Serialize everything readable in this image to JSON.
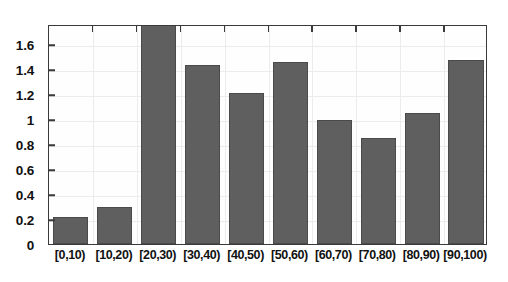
{
  "chart_data": {
    "type": "bar",
    "title": "",
    "xlabel": "",
    "ylabel": "",
    "categories": [
      "[0,10)",
      "[10,20)",
      "[20,30)",
      "[30,40)",
      "[40,50)",
      "[50,60)",
      "[60,70)",
      "[70,80)",
      "[80,90)",
      "[90,100)"
    ],
    "values": [
      0.22,
      0.3,
      1.76,
      1.43,
      1.21,
      1.46,
      0.99,
      0.85,
      1.05,
      1.47
    ],
    "value_notes": {
      "bar_3_clipped": "The [20,30) bar is clipped at the top of the plot box; its true value is at or above 1.76."
    },
    "ylim": [
      0,
      1.76
    ],
    "yticks": [
      0,
      0.2,
      0.4,
      0.6,
      0.8,
      1,
      1.2,
      1.4,
      1.6
    ],
    "ytick_labels": [
      "0",
      "0.2",
      "0.4",
      "0.6",
      "0.8",
      "1",
      "1.2",
      "1.4",
      "1.6"
    ],
    "grid": true,
    "legend": null,
    "bar_color": "#5f5f5f",
    "bar_edge_color": "#4a4a4a",
    "axis_color": "#3a3a3a",
    "background_color": "#ffffff"
  }
}
